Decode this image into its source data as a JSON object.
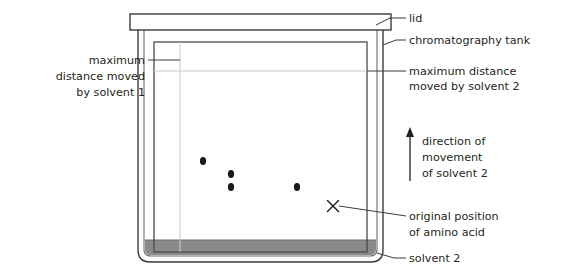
{
  "diagram": {
    "type": "paper-chromatography-tank",
    "title_text": null,
    "colors": {
      "outline": "#3b3b3b",
      "inner_outline": "#4a4a4a",
      "guide_line": "#c9c9c9",
      "solvent_fill": "#8a8a8a",
      "lid_fill": "#ffffff",
      "spot_fill": "#1a1a1a",
      "text": "#231f20",
      "leader": "#3b3b3b"
    },
    "labels": {
      "lid": "lid",
      "tank": "chromatography tank",
      "max_solvent1_line1": "maximum",
      "max_solvent1_line2": "distance moved",
      "max_solvent1_line3": "by solvent 1",
      "max_solvent2_line1": "maximum distance",
      "max_solvent2_line2": "moved by solvent 2",
      "direction_line1": "direction of",
      "direction_line2": "movement",
      "direction_line3": "of solvent 2",
      "origin_line1": "original position",
      "origin_line2": "of amino acid",
      "solvent2": "solvent 2"
    },
    "spots": [
      {
        "name": "amino-acid-spot-1",
        "cx": 203,
        "cy": 161,
        "rx": 3.1,
        "ry": 3.9
      },
      {
        "name": "amino-acid-spot-2",
        "cx": 231,
        "cy": 174,
        "rx": 3.1,
        "ry": 3.9
      },
      {
        "name": "amino-acid-spot-3",
        "cx": 231,
        "cy": 187,
        "rx": 3.1,
        "ry": 3.9
      },
      {
        "name": "amino-acid-spot-4",
        "cx": 297,
        "cy": 187,
        "rx": 3.1,
        "ry": 3.9
      }
    ],
    "origin_mark": {
      "name": "origin-cross",
      "cx": 333,
      "cy": 206,
      "size": 6.5
    },
    "geometry": {
      "lid": {
        "x": 130,
        "y": 14,
        "w": 261,
        "h": 16
      },
      "tank_outer": {
        "x": 138,
        "y": 30,
        "w": 245,
        "h": 232,
        "corner_radius": 10
      },
      "tank_inner": {
        "x": 143,
        "y": 30,
        "w": 235,
        "h": 227,
        "corner_radius": 7
      },
      "paper": {
        "x": 154,
        "y": 42,
        "w": 213,
        "h": 210
      },
      "solvent_level_y": 240,
      "solvent_bottom_y": 257,
      "solvent1_line_x": 180,
      "solvent2_line_y": 71
    },
    "arrow": {
      "name": "direction-arrow",
      "x": 410,
      "y_top": 130,
      "y_bottom": 181,
      "points": "up"
    }
  }
}
